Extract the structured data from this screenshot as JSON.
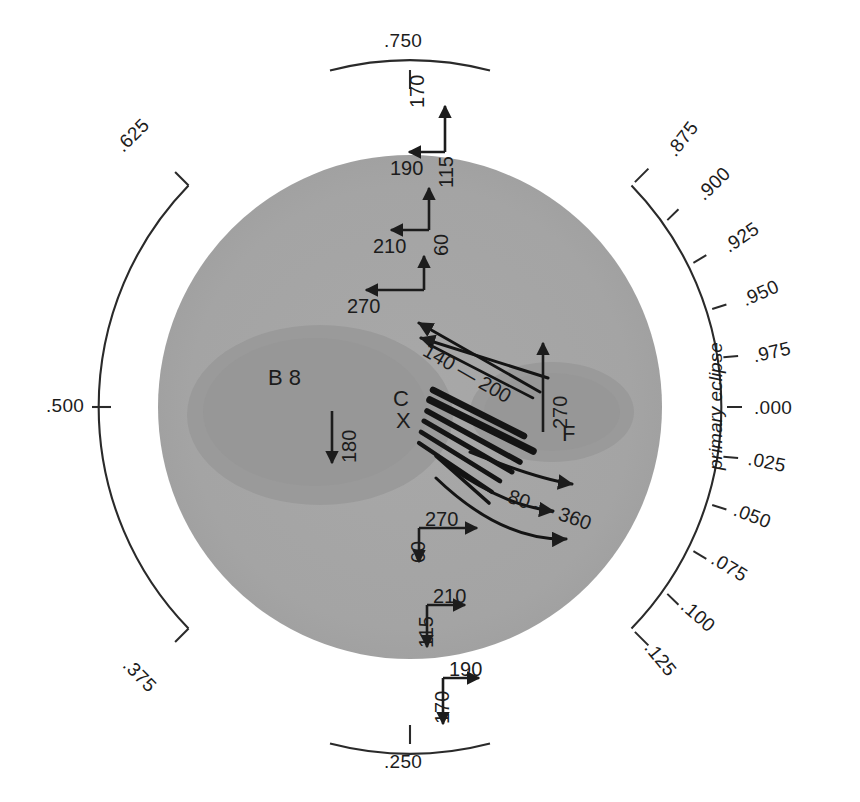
{
  "figure": {
    "kind": "stellar-surface-phase-map",
    "arc_annotation": "primary eclipse",
    "colors": {
      "background": "#ffffff",
      "disk": "#a5a5a5",
      "spot": "#989898",
      "ink": "#1c1c1c",
      "streak": "#141414"
    }
  },
  "phase_scale": {
    "major": [
      {
        "value": ".750",
        "angle_deg": -90
      },
      {
        "value": ".625",
        "angle_deg": -135
      },
      {
        "value": ".500",
        "angle_deg": 180
      },
      {
        "value": ".375",
        "angle_deg": 135
      },
      {
        "value": ".250",
        "angle_deg": 90
      }
    ],
    "minor_right": [
      {
        "value": ".875",
        "angle_deg": -45
      },
      {
        "value": ".900",
        "angle_deg": -36
      },
      {
        "value": ".925",
        "angle_deg": -27
      },
      {
        "value": ".950",
        "angle_deg": -18
      },
      {
        "value": ".975",
        "angle_deg": -9
      },
      {
        "value": ".000",
        "angle_deg": 0
      },
      {
        "value": ".025",
        "angle_deg": 9
      },
      {
        "value": ".050",
        "angle_deg": 18
      },
      {
        "value": ".075",
        "angle_deg": 27
      },
      {
        "value": ".100",
        "angle_deg": 36
      },
      {
        "value": ".125",
        "angle_deg": 45
      }
    ]
  },
  "features": [
    {
      "id": "feature-b8",
      "label": "B 8"
    },
    {
      "id": "feature-c",
      "label": "C"
    },
    {
      "id": "feature-x",
      "label": "X"
    },
    {
      "id": "feature-f",
      "label": "F"
    }
  ],
  "vectors": {
    "top": [
      {
        "id": "top-1",
        "horizontal": "190",
        "vertical": "170"
      },
      {
        "id": "top-2",
        "horizontal": "210",
        "vertical": "115"
      },
      {
        "id": "top-3",
        "horizontal": "270",
        "vertical": "60"
      }
    ],
    "bottom": [
      {
        "id": "bottom-1",
        "horizontal": "270",
        "vertical": "60"
      },
      {
        "id": "bottom-2",
        "horizontal": "210",
        "vertical": "115"
      },
      {
        "id": "bottom-3",
        "horizontal": "190",
        "vertical": "170"
      }
    ],
    "interior": [
      {
        "id": "vec-180",
        "label": "180"
      },
      {
        "id": "vec-270-f",
        "label": "270"
      }
    ],
    "streak_groups": [
      {
        "id": "streak-upper",
        "label": "140 — 200"
      },
      {
        "id": "streak-lower",
        "label": "80 — 360"
      }
    ]
  }
}
